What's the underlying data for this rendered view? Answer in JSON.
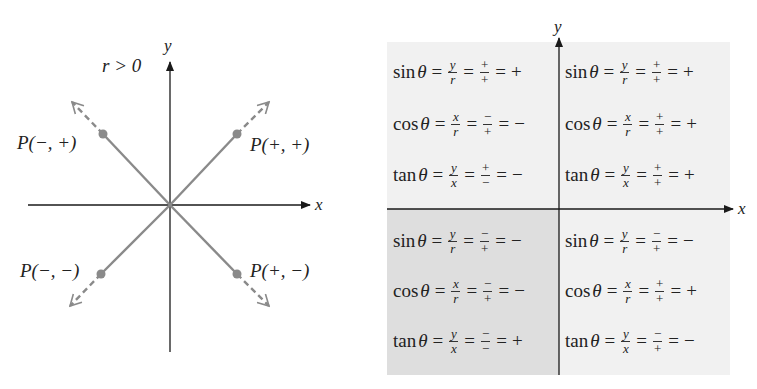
{
  "colors": {
    "ray": "#8a8a8a",
    "point": "#8a8a8a",
    "axis": "#1a1a1a",
    "panel_light": "#f1f1f1",
    "panel_dark": "#dedede"
  },
  "left_diagram": {
    "condition": "r > 0",
    "axis_x_label": "x",
    "axis_y_label": "y",
    "points": [
      {
        "label": "P(−, +)",
        "quadrant": "II"
      },
      {
        "label": "P(+, +)",
        "quadrant": "I"
      },
      {
        "label": "P(−, −)",
        "quadrant": "III"
      },
      {
        "label": "P(+, −)",
        "quadrant": "IV"
      }
    ]
  },
  "right_table": {
    "axis_x_label": "x",
    "axis_y_label": "y",
    "quadrants": {
      "II": [
        {
          "fn": "sin",
          "theta": "θ",
          "ratio_num": "y",
          "ratio_den": "r",
          "sign_num": "+",
          "sign_den": "+",
          "result": "+"
        },
        {
          "fn": "cos",
          "theta": "θ",
          "ratio_num": "x",
          "ratio_den": "r",
          "sign_num": "−",
          "sign_den": "+",
          "result": "−"
        },
        {
          "fn": "tan",
          "theta": "θ",
          "ratio_num": "y",
          "ratio_den": "x",
          "sign_num": "+",
          "sign_den": "−",
          "result": "−"
        }
      ],
      "I": [
        {
          "fn": "sin",
          "theta": "θ",
          "ratio_num": "y",
          "ratio_den": "r",
          "sign_num": "+",
          "sign_den": "+",
          "result": "+"
        },
        {
          "fn": "cos",
          "theta": "θ",
          "ratio_num": "x",
          "ratio_den": "r",
          "sign_num": "+",
          "sign_den": "+",
          "result": "+"
        },
        {
          "fn": "tan",
          "theta": "θ",
          "ratio_num": "y",
          "ratio_den": "x",
          "sign_num": "+",
          "sign_den": "+",
          "result": "+"
        }
      ],
      "III": [
        {
          "fn": "sin",
          "theta": "θ",
          "ratio_num": "y",
          "ratio_den": "r",
          "sign_num": "−",
          "sign_den": "+",
          "result": "−"
        },
        {
          "fn": "cos",
          "theta": "θ",
          "ratio_num": "x",
          "ratio_den": "r",
          "sign_num": "−",
          "sign_den": "+",
          "result": "−"
        },
        {
          "fn": "tan",
          "theta": "θ",
          "ratio_num": "y",
          "ratio_den": "x",
          "sign_num": "−",
          "sign_den": "−",
          "result": "+"
        }
      ],
      "IV": [
        {
          "fn": "sin",
          "theta": "θ",
          "ratio_num": "y",
          "ratio_den": "r",
          "sign_num": "−",
          "sign_den": "+",
          "result": "−"
        },
        {
          "fn": "cos",
          "theta": "θ",
          "ratio_num": "x",
          "ratio_den": "r",
          "sign_num": "+",
          "sign_den": "+",
          "result": "+"
        },
        {
          "fn": "tan",
          "theta": "θ",
          "ratio_num": "y",
          "ratio_den": "x",
          "sign_num": "−",
          "sign_den": "+",
          "result": "−"
        }
      ]
    }
  },
  "symbols": {
    "equals": "="
  }
}
